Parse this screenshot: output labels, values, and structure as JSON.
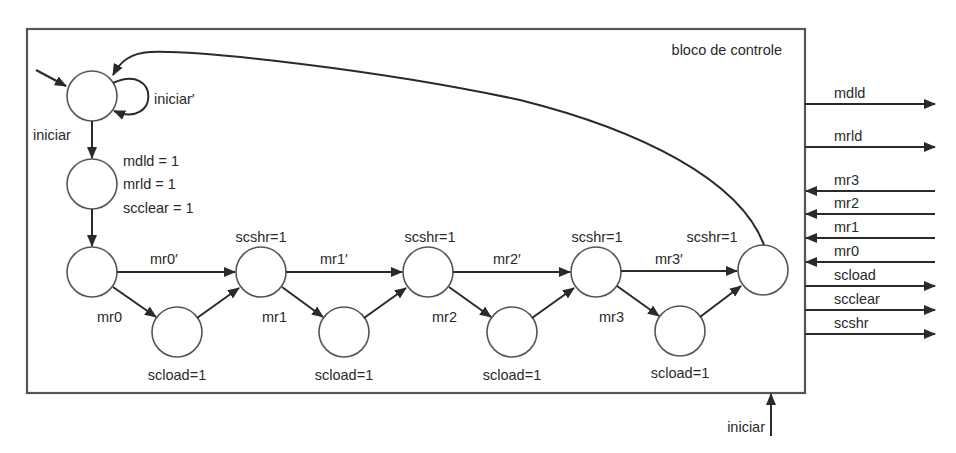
{
  "block": {
    "title": "bloco de controle"
  },
  "colors": {
    "stroke": "#2a2a2a",
    "node_stroke": "#555555",
    "background": "#ffffff"
  },
  "states": {
    "s0": {
      "self_loop": "iniciar′",
      "exit": "iniciar"
    },
    "s1": {
      "outputs": [
        "mdld = 1",
        "mrld = 1",
        "scclear = 1"
      ]
    },
    "bit_stages": [
      {
        "skip": "mr0′",
        "take": "mr0",
        "load": "scload=1",
        "shift": "scshr=1"
      },
      {
        "skip": "mr1′",
        "take": "mr1",
        "load": "scload=1",
        "shift": "scshr=1"
      },
      {
        "skip": "mr2′",
        "take": "mr2",
        "load": "scload=1",
        "shift": "scshr=1"
      },
      {
        "skip": "mr3′",
        "take": "mr3",
        "load": "scload=1",
        "shift": "scshr=1"
      }
    ]
  },
  "ports": {
    "outputs_top": [
      "mdld",
      "mrld"
    ],
    "inputs": [
      "mr3",
      "mr2",
      "mr1",
      "mr0"
    ],
    "outputs_bottom": [
      "scload",
      "scclear",
      "scshr"
    ],
    "bottom_input": "iniciar"
  }
}
